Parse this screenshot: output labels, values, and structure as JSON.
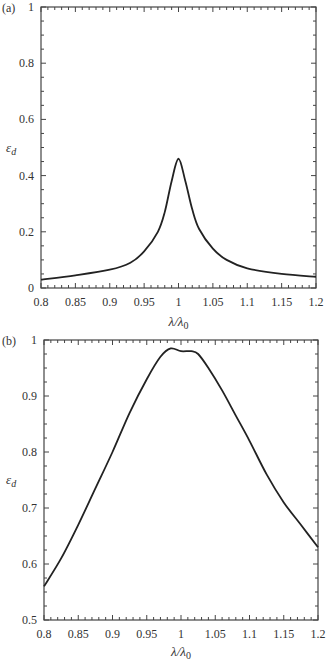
{
  "chart_data": [
    {
      "panel": "(a)",
      "type": "line",
      "xlabel": "λ/λ0",
      "ylabel": "ε_d",
      "xlim": [
        0.8,
        1.2
      ],
      "ylim": [
        0,
        1
      ],
      "xticks": [
        "0.8",
        "0.85",
        "0.9",
        "0.95",
        "1",
        "1.05",
        "1.1",
        "1.15",
        "1.2"
      ],
      "yticks": [
        "0",
        "0.2",
        "0.4",
        "0.6",
        "0.8",
        "1"
      ],
      "grid": false,
      "series": [
        {
          "name": "ε_d",
          "x": [
            0.8,
            0.85,
            0.9,
            0.93,
            0.95,
            0.97,
            0.98,
            0.99,
            1.0,
            1.01,
            1.02,
            1.03,
            1.05,
            1.07,
            1.1,
            1.15,
            1.2
          ],
          "y": [
            0.03,
            0.045,
            0.065,
            0.09,
            0.13,
            0.2,
            0.27,
            0.38,
            0.46,
            0.38,
            0.28,
            0.21,
            0.14,
            0.1,
            0.07,
            0.05,
            0.04
          ]
        }
      ]
    },
    {
      "panel": "(b)",
      "type": "line",
      "xlabel": "λ/λ0",
      "ylabel": "ε_d",
      "xlim": [
        0.8,
        1.2
      ],
      "ylim": [
        0.5,
        1
      ],
      "xticks": [
        "0.8",
        "0.85",
        "0.9",
        "0.95",
        "1",
        "1.05",
        "1.1",
        "1.15",
        "1.2"
      ],
      "yticks": [
        "0.5",
        "0.6",
        "0.7",
        "0.8",
        "0.9",
        "1"
      ],
      "grid": false,
      "series": [
        {
          "name": "ε_d",
          "x": [
            0.8,
            0.825,
            0.85,
            0.875,
            0.9,
            0.925,
            0.95,
            0.97,
            0.985,
            1.0,
            1.015,
            1.025,
            1.04,
            1.06,
            1.08,
            1.1,
            1.125,
            1.15,
            1.175,
            1.2
          ],
          "y": [
            0.56,
            0.61,
            0.67,
            0.735,
            0.8,
            0.87,
            0.93,
            0.97,
            0.985,
            0.98,
            0.98,
            0.975,
            0.95,
            0.91,
            0.865,
            0.82,
            0.76,
            0.71,
            0.67,
            0.63
          ]
        }
      ]
    }
  ],
  "labels": {
    "panel_a": "(a)",
    "panel_b": "(b)",
    "xlabel_a": "λ/λ0",
    "xlabel_b": "λ/λ0",
    "ylabel_a": "ε_d",
    "ylabel_b": "ε_d"
  }
}
